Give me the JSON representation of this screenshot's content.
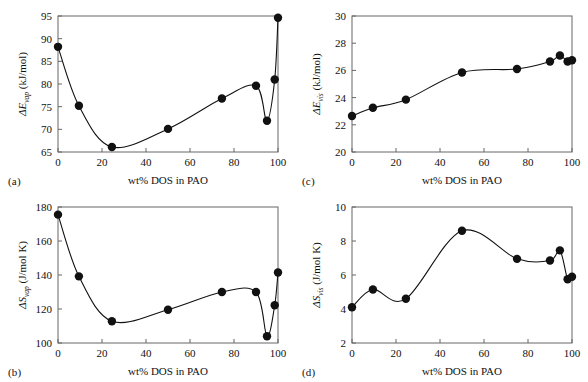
{
  "figure": {
    "background": "#ffffff",
    "marker_color": "#111111",
    "line_color": "#111111",
    "axis_color": "#666666"
  },
  "chart_data": [
    {
      "type": "scatter",
      "panel": "a",
      "panel_label": "(a)",
      "title": "",
      "xlabel": "wt% DOS in PAO",
      "ylabel": "ΔE_vap (kJ/mol)",
      "ylabel_symbol": "ΔE",
      "ylabel_sub": "vap",
      "ylabel_units": "(kJ/mol)",
      "xlim": [
        0,
        100
      ],
      "ylim": [
        65,
        95
      ],
      "xticks": [
        0,
        20,
        40,
        60,
        80,
        100
      ],
      "yticks": [
        65,
        70,
        75,
        80,
        85,
        90,
        95
      ],
      "grid": false,
      "legend": "none",
      "x": [
        0,
        9.5,
        24.5,
        50,
        74.5,
        90,
        95,
        98.5,
        100
      ],
      "values": [
        88.2,
        75.2,
        66.1,
        70.1,
        76.8,
        79.6,
        71.9,
        81.0,
        94.6
      ]
    },
    {
      "type": "scatter",
      "panel": "b",
      "panel_label": "(b)",
      "title": "",
      "xlabel": "wt% DOS in PAO",
      "ylabel": "ΔS_vap (J/mol K)",
      "ylabel_symbol": "ΔS",
      "ylabel_sub": "vap",
      "ylabel_units": "(J/mol K)",
      "xlim": [
        0,
        100
      ],
      "ylim": [
        100,
        180
      ],
      "xticks": [
        0,
        20,
        40,
        60,
        80,
        100
      ],
      "yticks": [
        100,
        120,
        140,
        160,
        180
      ],
      "grid": false,
      "legend": "none",
      "x": [
        0,
        9.5,
        24.5,
        50,
        74.5,
        90,
        95,
        98.5,
        100
      ],
      "values": [
        175.5,
        139.2,
        112.8,
        119.6,
        130.0,
        130.0,
        104.0,
        122.2,
        141.5
      ]
    },
    {
      "type": "scatter",
      "panel": "c",
      "panel_label": "(c)",
      "title": "",
      "xlabel": "wt% DOS in PAO",
      "ylabel": "ΔE_vis (kJ/mol)",
      "ylabel_symbol": "ΔE",
      "ylabel_sub": "vis",
      "ylabel_units": "(kJ/mol)",
      "xlim": [
        0,
        100
      ],
      "ylim": [
        20,
        30
      ],
      "xticks": [
        0,
        20,
        40,
        60,
        80,
        100
      ],
      "yticks": [
        20,
        22,
        24,
        26,
        28,
        30
      ],
      "grid": false,
      "legend": "none",
      "x": [
        0,
        9.5,
        24.5,
        50,
        75,
        90,
        94.5,
        98,
        100
      ],
      "values": [
        22.65,
        23.25,
        23.85,
        25.85,
        26.1,
        26.65,
        27.1,
        26.65,
        26.75
      ]
    },
    {
      "type": "scatter",
      "panel": "d",
      "panel_label": "(d)",
      "title": "",
      "xlabel": "wt% DOS in PAO",
      "ylabel": "ΔS_vis (J/mol K)",
      "ylabel_symbol": "ΔS",
      "ylabel_sub": "vis",
      "ylabel_units": "(J/mol K)",
      "xlim": [
        0,
        100
      ],
      "ylim": [
        2,
        10
      ],
      "xticks": [
        0,
        20,
        40,
        60,
        80,
        100
      ],
      "yticks": [
        2,
        4,
        6,
        8,
        10
      ],
      "grid": false,
      "legend": "none",
      "x": [
        0,
        9.5,
        24.5,
        50,
        75,
        90,
        94.5,
        98,
        100
      ],
      "values": [
        4.1,
        5.15,
        4.6,
        8.6,
        6.95,
        6.85,
        7.45,
        5.75,
        5.9
      ]
    }
  ]
}
